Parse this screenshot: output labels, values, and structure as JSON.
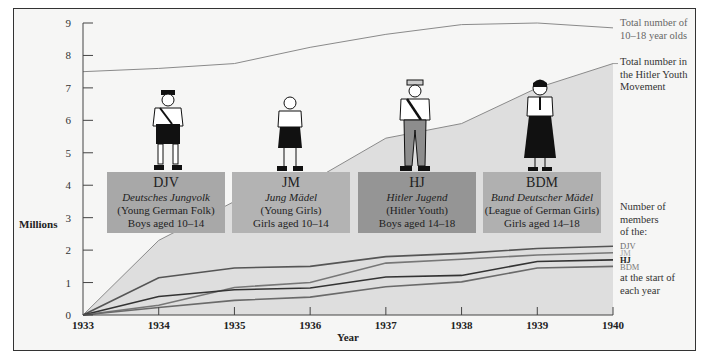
{
  "chart_data": {
    "type": "line",
    "title": "",
    "xlabel": "Year",
    "ylabel": "Millions",
    "ylim": [
      0,
      9
    ],
    "yticks": [
      0,
      1,
      2,
      3,
      4,
      5,
      6,
      7,
      8,
      9
    ],
    "x": [
      1933,
      1934,
      1935,
      1936,
      1937,
      1938,
      1939,
      1940
    ],
    "grid": false,
    "series": [
      {
        "name": "Total number of 10-18 year olds",
        "values": [
          7.5,
          7.6,
          7.75,
          8.25,
          8.65,
          8.95,
          9.0,
          8.85
        ],
        "color": "#8a8a8a"
      },
      {
        "name": "Total number in the Hitler Youth Movement",
        "values": [
          0,
          2.3,
          3.5,
          4.1,
          5.45,
          5.9,
          7.0,
          7.75
        ],
        "color": "#8a8a8a",
        "fill": "#dedede"
      },
      {
        "name": "DJV",
        "values": [
          0,
          1.15,
          1.45,
          1.5,
          1.8,
          1.9,
          2.05,
          2.12
        ],
        "color": "#555555"
      },
      {
        "name": "JM",
        "values": [
          0,
          0.3,
          0.85,
          1.0,
          1.6,
          1.72,
          1.85,
          1.92
        ],
        "color": "#777777"
      },
      {
        "name": "HJ",
        "values": [
          0,
          0.57,
          0.78,
          0.83,
          1.17,
          1.22,
          1.65,
          1.7
        ],
        "color": "#333333"
      },
      {
        "name": "BDM",
        "values": [
          0,
          0.23,
          0.45,
          0.55,
          0.87,
          1.02,
          1.45,
          1.5
        ],
        "color": "#6a6a6a"
      }
    ],
    "annotations": [
      "Total number of 10–18 year olds",
      "Total number in the Hitler Youth Movement",
      "Number of members of the:",
      "at the start of each year"
    ]
  },
  "axis": {
    "y_title": "Millions",
    "x_title": "Year",
    "y_ticks": [
      "0",
      "1",
      "2",
      "3",
      "4",
      "5",
      "6",
      "7",
      "8",
      "9"
    ],
    "x_ticks": [
      "1933",
      "1934",
      "1935",
      "1936",
      "1937",
      "1938",
      "1939",
      "1940"
    ]
  },
  "annotations": {
    "total_1018_line1": "Total number of",
    "total_1018_line2": "10–18 year olds",
    "total_hy_line1": "Total number in",
    "total_hy_line2": "the Hitler Youth",
    "total_hy_line3": "Movement",
    "members_line1": "Number of",
    "members_line2": "members",
    "members_line3": "of the:",
    "start_line1": "at the start of",
    "start_line2": "each year"
  },
  "legend": [
    {
      "label": "DJV",
      "color": "#6b6b6b",
      "bold": false
    },
    {
      "label": "JM",
      "color": "#a5a5a5",
      "bold": false
    },
    {
      "label": "HJ",
      "color": "#222222",
      "bold": true
    },
    {
      "label": "BDM",
      "color": "#7a7a7a",
      "bold": false
    }
  ],
  "panels": [
    {
      "abbr": "DJV",
      "german": "Deutsches Jungvolk",
      "english": "(Young German Folk)",
      "ages": "Boys aged 10–14",
      "color": "#a8a8a8"
    },
    {
      "abbr": "JM",
      "german": "Jung Mädel",
      "english": "(Young Girls)",
      "ages": "Girls aged 10–14",
      "color": "#b3b3b3"
    },
    {
      "abbr": "HJ",
      "german": "Hitler Jugend",
      "english": "(Hitler  Youth)",
      "ages": "Boys aged 14–18",
      "color": "#959595"
    },
    {
      "abbr": "BDM",
      "german": "Bund Deutscher Mädel",
      "english": "(League of German Girls)",
      "ages": "Girls aged 14–18",
      "color": "#b0b0b0"
    }
  ]
}
